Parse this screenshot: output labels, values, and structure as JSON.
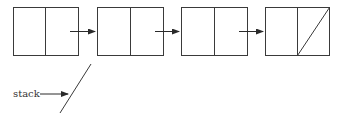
{
  "diagram": {
    "stroke_color": "#3a3a3a",
    "nodes": [
      {
        "id": "node-1",
        "x": 13,
        "y": 7,
        "w": 65,
        "h": 48,
        "divider": 45,
        "null_next": false
      },
      {
        "id": "node-2",
        "x": 97,
        "y": 7,
        "w": 66,
        "h": 48,
        "divider": 130,
        "null_next": false
      },
      {
        "id": "node-3",
        "x": 181,
        "y": 7,
        "w": 66,
        "h": 48,
        "divider": 214,
        "null_next": false
      },
      {
        "id": "node-4",
        "x": 265,
        "y": 7,
        "w": 64,
        "h": 48,
        "divider": 297,
        "null_next": true
      }
    ],
    "arrows": [
      {
        "from": "node-1",
        "to": "node-2"
      },
      {
        "from": "node-2",
        "to": "node-3"
      },
      {
        "from": "node-3",
        "to": "node-4"
      }
    ],
    "pointer": {
      "label": "stack",
      "target": "null"
    }
  }
}
